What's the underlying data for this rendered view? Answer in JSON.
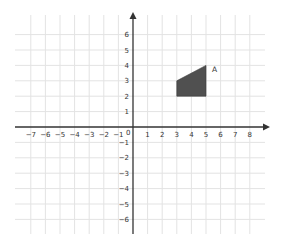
{
  "diagram": {
    "type": "coordinate-plane",
    "x_range": [
      -7,
      8
    ],
    "y_range": [
      -6,
      6
    ],
    "origin_label": "0",
    "x_tick_labels": [
      "-7",
      "-6",
      "-5",
      "-4",
      "-3",
      "-2",
      "-1",
      "1",
      "2",
      "3",
      "4",
      "5",
      "6",
      "7",
      "8"
    ],
    "y_tick_labels": [
      "6",
      "5",
      "4",
      "3",
      "2",
      "1",
      "-1",
      "-2",
      "-3",
      "-4",
      "-5",
      "-6"
    ],
    "shape": {
      "label": "A",
      "vertices": [
        [
          3,
          2
        ],
        [
          5,
          2
        ],
        [
          5,
          4
        ],
        [
          3,
          3
        ]
      ],
      "fill": "#505050"
    },
    "colors": {
      "grid": "#e3e3e3",
      "axis": "#333333",
      "background": "#ffffff"
    }
  }
}
